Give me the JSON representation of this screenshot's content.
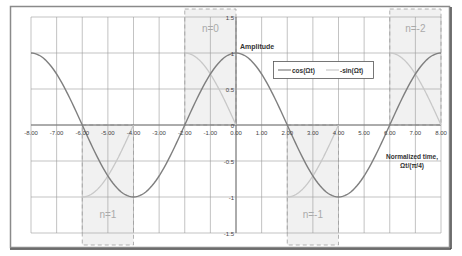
{
  "chart_data": {
    "type": "line",
    "title": "",
    "xlabel": "Normalized time, Ωt/(π/4)",
    "xlabel_line1": "Normalized time,",
    "xlabel_line2": "Ωt/(π/4)",
    "ylabel": "Amplitude",
    "xlim": [
      -8,
      8
    ],
    "ylim": [
      -1.5,
      1.5
    ],
    "x_ticks": [
      -8,
      -7,
      -6,
      -5,
      -4,
      -3,
      -2,
      -1,
      0,
      1,
      2,
      3,
      4,
      5,
      6,
      7,
      8
    ],
    "x_tick_labels": [
      "-8.00",
      "-7.00",
      "-6.00",
      "-5.00",
      "-4.00",
      "-3.00",
      "-2.00",
      "-1.00",
      "0.00",
      "1.00",
      "2.00",
      "3.00",
      "4.00",
      "5.00",
      "6.00",
      "7.00",
      "8.00"
    ],
    "y_ticks": [
      1.5,
      1,
      0.5,
      0,
      -0.5,
      -1,
      -1.5
    ],
    "y_tick_labels": [
      "1.5",
      "1",
      "0.5",
      "0",
      "-0.5",
      "-1",
      "-1.5"
    ],
    "grid": true,
    "legend_position": "upper-center-right",
    "series": [
      {
        "name": "cos(Ωt)",
        "color": "#7f7f7f",
        "x": [
          -8,
          -7,
          -6,
          -5,
          -4,
          -3,
          -2,
          -1,
          0,
          1,
          2,
          3,
          4,
          5,
          6,
          7,
          8
        ],
        "values": [
          1,
          0.707,
          0,
          -0.707,
          -1,
          -0.707,
          0,
          0.707,
          1,
          0.707,
          0,
          -0.707,
          -1,
          -0.707,
          0,
          0.707,
          1
        ]
      },
      {
        "name": "-sin(Ωt)",
        "color": "#c8c8c8",
        "x": [
          -8,
          -7,
          -6,
          -5,
          -4,
          -3,
          -2,
          -1,
          0,
          1,
          2,
          3,
          4,
          5,
          6,
          7,
          8
        ],
        "values": [
          0,
          -0.707,
          -1,
          -0.707,
          0,
          0.707,
          1,
          0.707,
          0,
          -0.707,
          -1,
          -0.707,
          0,
          0.707,
          1,
          0.707,
          0
        ],
        "drawn_segments": [
          [
            -6,
            -4
          ],
          [
            -2,
            0
          ],
          [
            2,
            4
          ],
          [
            6,
            8
          ]
        ]
      }
    ],
    "annotations": [
      {
        "text": "n=0",
        "x_range": [
          -2,
          0
        ],
        "y_range": [
          0,
          1.5
        ]
      },
      {
        "text": "n=-2",
        "x_range": [
          6,
          8
        ],
        "y_range": [
          0,
          1.5
        ]
      },
      {
        "text": "n=1",
        "x_range": [
          -6,
          -4
        ],
        "y_range": [
          -1.5,
          0
        ]
      },
      {
        "text": "n=-1",
        "x_range": [
          2,
          4
        ],
        "y_range": [
          -1.5,
          0
        ]
      }
    ]
  },
  "legend": {
    "items": [
      "cos(Ωt)",
      "-sin(Ωt)"
    ]
  }
}
